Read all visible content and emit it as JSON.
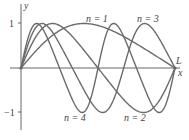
{
  "chart_data": {
    "type": "line",
    "title": "",
    "xlabel": "x",
    "ylabel": "y",
    "xlim": [
      0,
      1
    ],
    "ylim": [
      -1,
      1
    ],
    "yticks": [
      1,
      -1
    ],
    "ytick_labels": [
      "1",
      "−1"
    ],
    "x_end_label": "L",
    "series": [
      {
        "name": "n = 1",
        "n": 1,
        "label": "n = 1"
      },
      {
        "name": "n = 2",
        "n": 2,
        "label": "n = 2"
      },
      {
        "name": "n = 3",
        "n": 3,
        "label": "n = 3"
      },
      {
        "name": "n = 4",
        "n": 4,
        "label": "n = 4"
      }
    ],
    "grid": false,
    "legend": "inline labels"
  },
  "labels": {
    "y_axis": "y",
    "x_axis": "x",
    "L": "L",
    "tick_pos": "1",
    "tick_neg": "−1",
    "n1": "n = 1",
    "n2": "n = 2",
    "n3": "n = 3",
    "n4": "n = 4"
  },
  "colors": {
    "curve": "#6b6b6b",
    "axis": "#555555"
  }
}
